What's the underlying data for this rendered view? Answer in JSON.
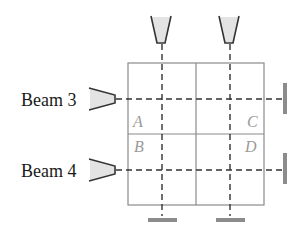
{
  "diagram": {
    "beams": [
      {
        "label": "Beam 3",
        "orientation": "horizontal",
        "y": 99
      },
      {
        "label": "Beam 4",
        "orientation": "horizontal",
        "y": 170
      }
    ],
    "vertical_beams": [
      {
        "x": 162
      },
      {
        "x": 230
      }
    ],
    "grid": {
      "left": 128,
      "top": 63,
      "right": 264,
      "bottom": 205,
      "mid_x": 196,
      "mid_y": 134,
      "cells": [
        {
          "label": "A",
          "position": "top-left"
        },
        {
          "label": "B",
          "position": "bottom-left"
        },
        {
          "label": "C",
          "position": "top-right"
        },
        {
          "label": "D",
          "position": "bottom-right"
        }
      ]
    },
    "colors": {
      "grid_line": "#8a8a8a",
      "beam_line": "#333333",
      "emitter_outline": "#333333",
      "emitter_fill": "#e3e3e3",
      "detector": "#8c8c8c",
      "cell_label": "#9a9a9a",
      "text": "#1a1a1a"
    }
  }
}
